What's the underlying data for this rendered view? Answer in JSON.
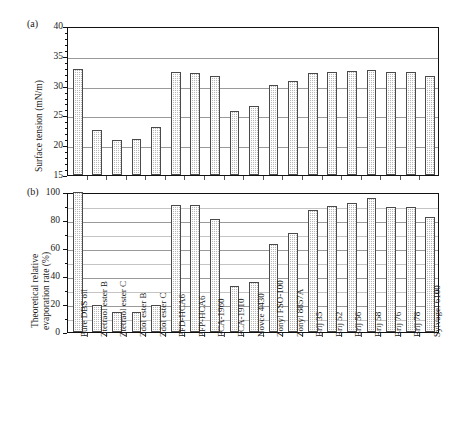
{
  "figure": {
    "panel_a_tag": "(a)",
    "panel_b_tag": "(b)"
  },
  "chart_data": [
    {
      "type": "bar",
      "panel": "(a)",
      "title": "",
      "xlabel": "",
      "ylabel": "Surface tension (mN/m)",
      "ylim": [
        15,
        40
      ],
      "yticks": [
        15,
        20,
        25,
        30,
        35,
        40
      ],
      "grid": true,
      "legend": "none",
      "categories": [
        "Pure DBS oil",
        "Ztetraol ester B",
        "Ztetraol ester C",
        "Zdol ester B",
        "Zdol ester C",
        "PFD-HCA6",
        "PFP-HCA6",
        "FCA-1960",
        "FCA-1910",
        "Novce 4430",
        "Zonyl FSO-100",
        "Zonyl 8857A",
        "Brij 35",
        "Brij 52",
        "Brij 56",
        "Brij 58",
        "Brij 76",
        "Brij 78",
        "Sylvagel 6100"
      ],
      "values": [
        32.8,
        22.5,
        20.9,
        21.1,
        23.0,
        32.3,
        32.2,
        31.6,
        25.8,
        26.5,
        30.1,
        30.8,
        32.2,
        32.3,
        32.4,
        32.6,
        32.3,
        32.3,
        31.6
      ]
    },
    {
      "type": "bar",
      "panel": "(b)",
      "title": "",
      "xlabel": "",
      "ylabel": "Theoretical relative evaporation rate (%)",
      "ylabel_line1": "Theoretical relative",
      "ylabel_line2": "evaporation rate (%)",
      "ylim": [
        0,
        100
      ],
      "yticks": [
        0,
        20,
        40,
        60,
        80,
        100
      ],
      "grid": true,
      "legend": "none",
      "categories": [
        "Pure DBS oil",
        "Ztetraol ester B",
        "Ztetraol ester C",
        "Zdol ester B",
        "Zdol ester C",
        "PFD-HCA6",
        "PFP-HCA6",
        "FCA-1960",
        "FCA-1910",
        "Novce 4430",
        "Zonyl FSO-100",
        "Zonyl 8857A",
        "Brij 35",
        "Brij 52",
        "Brij 56",
        "Brij 58",
        "Brij 76",
        "Brij 78",
        "Sylvagel 6100"
      ],
      "values": [
        100,
        19,
        14,
        14.5,
        19.5,
        91,
        90.5,
        81,
        33,
        36,
        63,
        71,
        87,
        90,
        92,
        96,
        89,
        89,
        82
      ]
    }
  ],
  "axis_a": {
    "ticks": [
      "15",
      "20",
      "25",
      "30",
      "35",
      "40"
    ]
  },
  "axis_b": {
    "ticks": [
      "0",
      "20",
      "40",
      "60",
      "80",
      "100"
    ]
  }
}
